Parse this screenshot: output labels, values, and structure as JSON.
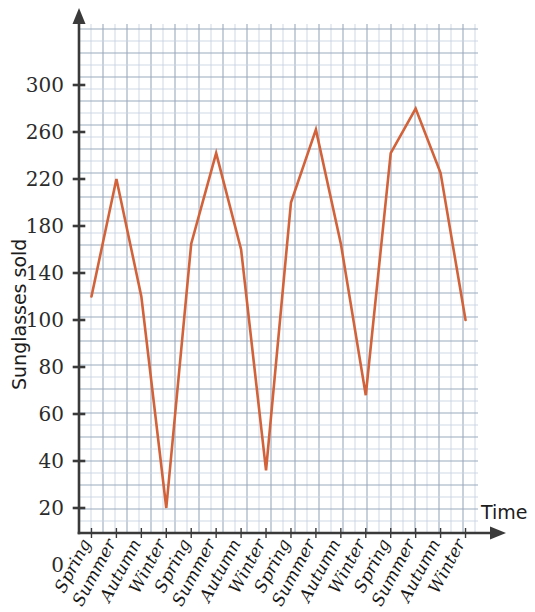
{
  "chart_data": {
    "type": "line",
    "title": "",
    "xlabel": "Time",
    "ylabel": "Sunglasses sold",
    "categories": [
      "Spring",
      "Summer",
      "Autumn",
      "Winter",
      "Spring",
      "Summer",
      "Autumn",
      "Winter",
      "Spring",
      "Summer",
      "Autumn",
      "Winter",
      "Spring",
      "Summer",
      "Autumn",
      "Winter"
    ],
    "values": [
      120,
      220,
      120,
      20,
      165,
      242,
      160,
      36,
      200,
      262,
      165,
      68,
      242,
      280,
      225,
      100
    ],
    "ytick_labels": [
      "0",
      "20",
      "40",
      "60",
      "80",
      "100",
      "140",
      "180",
      "220",
      "260",
      "300"
    ],
    "ytick_values": [
      0,
      20,
      40,
      60,
      80,
      100,
      140,
      180,
      220,
      260,
      300
    ],
    "ylim": [
      0,
      300
    ],
    "grid": true,
    "legend": null,
    "series_color": "#d2623a",
    "grid_color": "#c9d4e3",
    "axis_color": "#3a3a3a"
  },
  "axes": {
    "y_title": "Sunglasses sold",
    "x_title": "Time",
    "origin_label": "0"
  }
}
